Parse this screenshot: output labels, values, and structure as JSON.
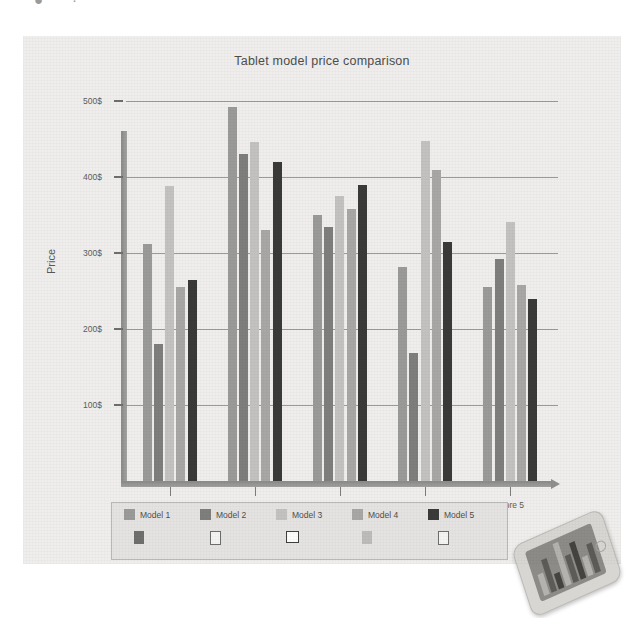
{
  "page": {
    "top_cut_glyphs": [
      "●",
      "·"
    ]
  },
  "figure": {
    "title": "Tablet model price comparison"
  },
  "axes": {
    "ylabel": "Price",
    "yticks": [
      "100$",
      "200$",
      "300$",
      "400$",
      "500$"
    ],
    "ytick_values": [
      100,
      200,
      300,
      400,
      500
    ],
    "xticks": [
      "Store 1",
      "Store 2",
      "Store 3",
      "Store 4",
      "Store 5"
    ]
  },
  "legend": {
    "items": [
      {
        "label": "Model 1",
        "swatch": "filled",
        "color": "#9a9a98"
      },
      {
        "label": "Model 2",
        "swatch": "filled",
        "color": "#7e7e7c"
      },
      {
        "label": "Model 3",
        "swatch": "filled",
        "color": "#c3c2c0"
      },
      {
        "label": "Model 4",
        "swatch": "filled",
        "color": "#a8a7a5"
      },
      {
        "label": "Model 5",
        "swatch": "filled",
        "color": "#3a3a38"
      }
    ],
    "row2": [
      {
        "swatch": "filled",
        "color": "#6f6f6d"
      },
      {
        "swatch": "outline",
        "color": "#6d6d6b"
      },
      {
        "swatch": "outline-bold",
        "color": "#3f3f3d"
      },
      {
        "swatch": "filled",
        "color": "#bdbcba"
      },
      {
        "swatch": "outline",
        "color": "#6d6d6b"
      }
    ]
  },
  "device": {
    "name": "tablet-photo",
    "screen_bars": [
      22,
      34,
      16,
      44,
      28,
      38,
      20,
      30
    ]
  },
  "chart_data": {
    "type": "bar",
    "title": "Tablet model price comparison",
    "xlabel": "",
    "ylabel": "Price",
    "categories": [
      "Store 1",
      "Store 2",
      "Store 3",
      "Store 4",
      "Store 5"
    ],
    "ylim": [
      0,
      520
    ],
    "yticks": [
      100,
      200,
      300,
      400,
      500
    ],
    "ytick_labels": [
      "100$",
      "200$",
      "300$",
      "400$",
      "500$"
    ],
    "grid": true,
    "legend_position": "bottom",
    "series": [
      {
        "name": "Model 1",
        "color": "#9a9a98",
        "values": [
          312,
          492,
          350,
          282,
          256
        ]
      },
      {
        "name": "Model 2",
        "color": "#7e7e7c",
        "values": [
          180,
          430,
          335,
          168,
          292
        ]
      },
      {
        "name": "Model 3",
        "color": "#c3c2c0",
        "values": [
          388,
          446,
          375,
          448,
          341
        ]
      },
      {
        "name": "Model 4",
        "color": "#a8a7a5",
        "values": [
          256,
          330,
          358,
          410,
          258
        ]
      },
      {
        "name": "Model 5",
        "color": "#3a3a38",
        "values": [
          264,
          420,
          390,
          315,
          240
        ]
      }
    ]
  }
}
